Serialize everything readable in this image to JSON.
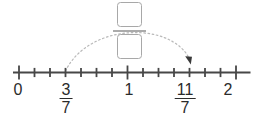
{
  "figure": {
    "type": "number-line-diagram",
    "number_line": {
      "tick_count": 15,
      "major_tick_indices": [
        0,
        7,
        14
      ],
      "min_label": "0",
      "max_label": "2"
    },
    "tick_labels": [
      {
        "kind": "integer",
        "value": "0"
      },
      {
        "kind": "fraction",
        "numerator": "3",
        "denominator": "7"
      },
      {
        "kind": "integer",
        "value": "1"
      },
      {
        "kind": "fraction",
        "numerator": "11",
        "denominator": "7"
      },
      {
        "kind": "integer",
        "value": "2"
      }
    ],
    "jump_arc": {
      "style": "dotted",
      "from": "3/7",
      "to": "11/7"
    },
    "answer_fraction": {
      "numerator": "",
      "denominator": ""
    },
    "colors": {
      "line": "#474747",
      "text": "#2b2b2b",
      "arc": "#b9b9b9",
      "arrow": "#3a3a3a",
      "box_border": "#a8a8a8",
      "answer_bar": "#ababab"
    }
  }
}
